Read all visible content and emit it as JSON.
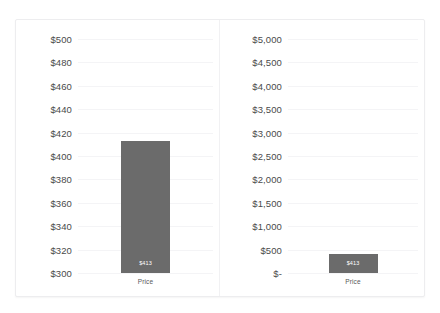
{
  "panel": {
    "background_color": "#ffffff",
    "border_color": "#ededef",
    "divider_color": "#f1f1f3"
  },
  "style": {
    "bar_color": "#6b6b6b",
    "gridline_color": "#f4f4f6",
    "tick_text_color": "#4a4a4a",
    "bar_label_color": "#ffffff",
    "category_label_color": "#585858"
  },
  "chart_data": [
    {
      "id": "left-chart",
      "type": "bar",
      "title": "",
      "xlabel": "",
      "ylabel": "",
      "categories": [
        "Price"
      ],
      "values": [
        413
      ],
      "data_labels": [
        "$413"
      ],
      "ylim": [
        300,
        500
      ],
      "ytick_values": [
        500,
        480,
        460,
        440,
        420,
        400,
        380,
        360,
        340,
        320,
        300
      ],
      "ytick_labels": [
        "$500",
        "$480",
        "$460",
        "$440",
        "$420",
        "$400",
        "$380",
        "$360",
        "$340",
        "$320",
        "$300"
      ],
      "grid": true,
      "legend": false,
      "legend_position": "none"
    },
    {
      "id": "right-chart",
      "type": "bar",
      "title": "",
      "xlabel": "",
      "ylabel": "",
      "categories": [
        "Price"
      ],
      "values": [
        413
      ],
      "data_labels": [
        "$413"
      ],
      "ylim": [
        0,
        5000
      ],
      "ytick_values": [
        5000,
        4500,
        4000,
        3500,
        3000,
        2500,
        2000,
        1500,
        1000,
        500,
        0
      ],
      "ytick_labels": [
        "$5,000",
        "$4,500",
        "$4,000",
        "$3,500",
        "$3,000",
        "$2,500",
        "$2,000",
        "$1,500",
        "$1,000",
        "$500",
        "$-"
      ],
      "grid": true,
      "legend": false,
      "legend_position": "none"
    }
  ]
}
